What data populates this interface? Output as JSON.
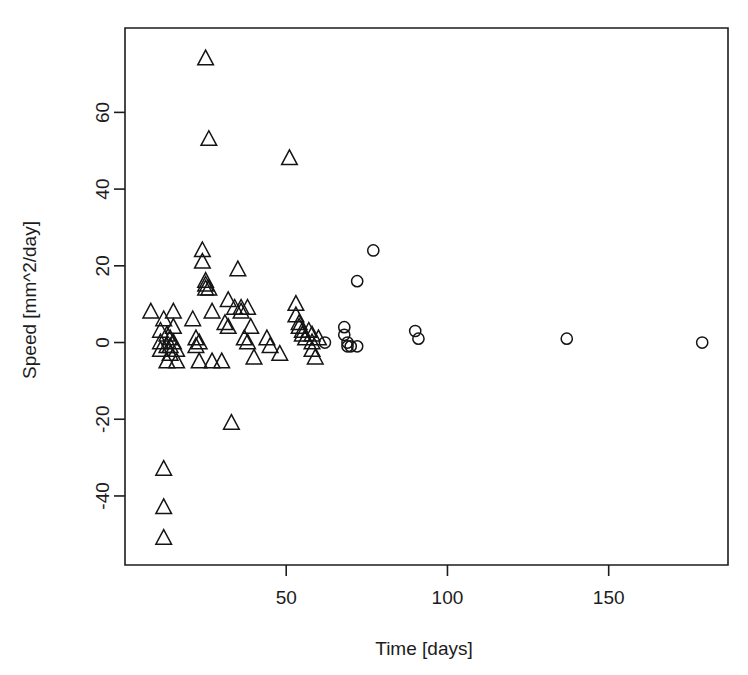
{
  "chart_data": {
    "type": "scatter",
    "title": "",
    "xlabel": "Time [days]",
    "ylabel": "Speed [mm^2/day]",
    "xlim": [
      0,
      187
    ],
    "ylim": [
      -58,
      82
    ],
    "xticks": [
      50,
      100,
      150
    ],
    "xticklabels": [
      "50",
      "100",
      "150"
    ],
    "yticks": [
      -40,
      -20,
      0,
      20,
      40,
      60
    ],
    "yticklabels": [
      "-40",
      "-20",
      "0",
      "20",
      "40",
      "60"
    ],
    "grid": false,
    "legend": "none",
    "frame": "box",
    "series": [
      {
        "name": "triangles",
        "marker": "triangle",
        "color": "#141414",
        "points": [
          [
            8,
            8
          ],
          [
            11,
            3
          ],
          [
            11,
            0
          ],
          [
            11,
            -2
          ],
          [
            12,
            6
          ],
          [
            13,
            2
          ],
          [
            13,
            -1
          ],
          [
            13,
            -5
          ],
          [
            14,
            1
          ],
          [
            14,
            -1
          ],
          [
            14,
            -3
          ],
          [
            15,
            8
          ],
          [
            15,
            4
          ],
          [
            15,
            0
          ],
          [
            16,
            -2
          ],
          [
            16,
            -5
          ],
          [
            12,
            -33
          ],
          [
            12,
            -43
          ],
          [
            12,
            -51
          ],
          [
            21,
            6
          ],
          [
            22,
            1
          ],
          [
            22,
            -1
          ],
          [
            23,
            0
          ],
          [
            23,
            -5
          ],
          [
            24,
            24
          ],
          [
            24,
            21
          ],
          [
            25,
            74
          ],
          [
            25,
            16
          ],
          [
            25,
            15
          ],
          [
            25,
            14
          ],
          [
            26,
            53
          ],
          [
            26,
            14
          ],
          [
            27,
            8
          ],
          [
            27,
            -5
          ],
          [
            30,
            -5
          ],
          [
            31,
            5
          ],
          [
            32,
            11
          ],
          [
            32,
            4
          ],
          [
            33,
            -21
          ],
          [
            34,
            9
          ],
          [
            35,
            19
          ],
          [
            36,
            9
          ],
          [
            36,
            8
          ],
          [
            37,
            1
          ],
          [
            38,
            9
          ],
          [
            38,
            0
          ],
          [
            39,
            4
          ],
          [
            40,
            -4
          ],
          [
            44,
            1
          ],
          [
            45,
            -1
          ],
          [
            48,
            -3
          ],
          [
            51,
            48
          ],
          [
            53,
            10
          ],
          [
            53,
            7
          ],
          [
            54,
            5
          ],
          [
            54,
            4
          ],
          [
            55,
            3
          ],
          [
            55,
            2
          ],
          [
            56,
            1
          ],
          [
            57,
            3
          ],
          [
            58,
            2
          ],
          [
            58,
            0
          ],
          [
            58,
            -2
          ],
          [
            59,
            -4
          ],
          [
            60,
            1
          ]
        ]
      },
      {
        "name": "circles",
        "marker": "circle",
        "color": "#141414",
        "points": [
          [
            62,
            0
          ],
          [
            68,
            4
          ],
          [
            68,
            2
          ],
          [
            69,
            0
          ],
          [
            69,
            -1
          ],
          [
            70,
            -1
          ],
          [
            72,
            -1
          ],
          [
            72,
            16
          ],
          [
            77,
            24
          ],
          [
            90,
            3
          ],
          [
            91,
            1
          ],
          [
            137,
            1
          ],
          [
            179,
            0
          ]
        ]
      }
    ]
  },
  "axes": {
    "x_label": "Time [days]",
    "y_label": "Speed [mm^2/day]"
  }
}
